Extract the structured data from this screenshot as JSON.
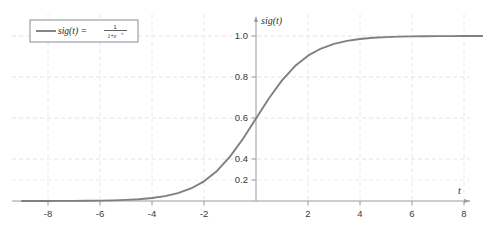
{
  "chart_data": {
    "type": "line",
    "title": "",
    "xlabel": "t",
    "ylabel": "sig(t)",
    "legend_label": "sig(t)  =",
    "legend_formula_numerator": "1",
    "legend_formula_denominator_base": "1+e",
    "legend_formula_denominator_exponent": "-t",
    "legend_formula_plain": "sig(t) = 1/(1+e^-t)",
    "legend_position": "top-left",
    "grid": true,
    "series_color": "#7f7f7f",
    "grid_color": "#e2e2e6",
    "axis_color": "#8f8f96",
    "xlim": [
      -9.4,
      8.9
    ],
    "ylim": [
      -0.12,
      1.16
    ],
    "xticks": [
      -8,
      -6,
      -4,
      -2,
      2,
      4,
      6,
      8
    ],
    "xtick_labels": [
      "-8",
      "-6",
      "-4",
      "-2",
      "2",
      "4",
      "6",
      "8"
    ],
    "yticks": [
      0.2,
      0.4,
      0.6,
      0.8,
      1.0
    ],
    "ytick_labels": [
      "0.2",
      "0.4",
      "0.6",
      "0.8",
      "1.0"
    ],
    "x": [
      -9.0,
      -8.5,
      -8.0,
      -7.5,
      -7.0,
      -6.5,
      -6.0,
      -5.5,
      -5.0,
      -4.5,
      -4.0,
      -3.5,
      -3.0,
      -2.5,
      -2.0,
      -1.5,
      -1.0,
      -0.5,
      0.0,
      0.5,
      1.0,
      1.5,
      2.0,
      2.5,
      3.0,
      3.5,
      4.0,
      4.5,
      5.0,
      5.5,
      6.0,
      6.5,
      7.0,
      7.5,
      8.0,
      8.5,
      8.7
    ],
    "y": [
      0.0001234,
      0.0002035,
      0.0003354,
      0.0005527,
      0.0009111,
      0.0015017,
      0.0024726,
      0.0040701,
      0.0066929,
      0.0109869,
      0.0179862,
      0.0293122,
      0.0474259,
      0.0758582,
      0.1192029,
      0.1824255,
      0.2689414,
      0.3775407,
      0.5,
      0.6224593,
      0.7310586,
      0.8175745,
      0.8807971,
      0.9241418,
      0.9525741,
      0.9706877,
      0.9820138,
      0.9890131,
      0.9933071,
      0.9959299,
      0.9975274,
      0.9984983,
      0.9990889,
      0.9994473,
      0.9996646,
      0.9997965,
      0.9998335
    ]
  }
}
